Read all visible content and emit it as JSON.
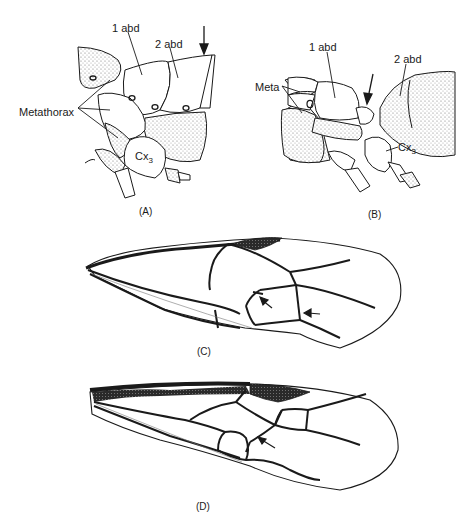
{
  "figure": {
    "panels": [
      {
        "id": "A",
        "caption": "(A)",
        "subject": "lateral view of metathorax and first abdominal segments",
        "labels": {
          "abd1": "1 abd",
          "abd2": "2 abd",
          "metathorax": "Metathorax",
          "coxa_base": "Cx",
          "coxa_sub": "3"
        },
        "arrows": 1
      },
      {
        "id": "B",
        "caption": "(B)",
        "subject": "lateral view showing petiolate first abdominal segment",
        "labels": {
          "abd1": "1 abd",
          "abd2": "2 abd",
          "meta": "Meta",
          "coxa_base": "Cx",
          "coxa_sub": "3"
        },
        "arrows": 1
      },
      {
        "id": "C",
        "caption": "(C)",
        "subject": "forewing venation",
        "arrows": 2
      },
      {
        "id": "D",
        "caption": "(D)",
        "subject": "forewing venation",
        "arrows": 1
      }
    ]
  }
}
